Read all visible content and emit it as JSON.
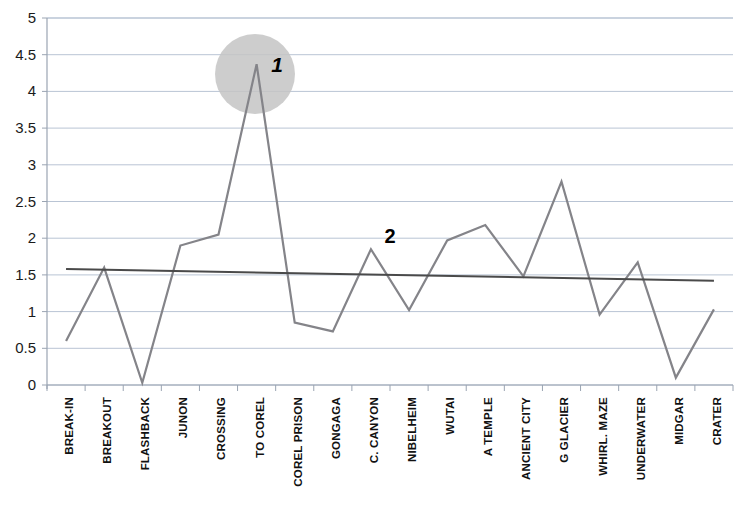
{
  "chart_data": {
    "type": "line",
    "title": "",
    "subtitle": "",
    "xlabel": "",
    "ylabel": "",
    "ylim": [
      0,
      5
    ],
    "yticks": [
      "0",
      "0.5",
      "1",
      "1.5",
      "2",
      "2.5",
      "3",
      "3.5",
      "4",
      "4.5",
      "5"
    ],
    "grid": true,
    "legend": "none",
    "categories": [
      "BREAK-IN",
      "BREAKOUT",
      "FLASHBACK",
      "JUNON",
      "CROSSING",
      "TO COREL",
      "COREL PRISON",
      "GONGAGA",
      "C. CANYON",
      "NIBELHEIM",
      "WUTAI",
      "A TEMPLE",
      "ANCIENT CITY",
      "G GLACIER",
      "WHIRL. MAZE",
      "UNDERWATER",
      "MIDGAR",
      "CRATER"
    ],
    "series": [
      {
        "name": "values",
        "color": "#848489",
        "values": [
          0.6,
          1.6,
          0.03,
          1.9,
          2.05,
          4.37,
          0.85,
          0.73,
          1.85,
          1.02,
          1.97,
          2.18,
          1.48,
          2.77,
          0.96,
          1.67,
          0.1,
          1.03
        ]
      },
      {
        "name": "trendline",
        "color": "#4a4a4a",
        "type": "linear-trend",
        "start_value": 1.58,
        "end_value": 1.42
      }
    ],
    "annotations": [
      {
        "label": "1",
        "kind": "highlight-circle-with-number",
        "target_category": "TO COREL",
        "circle_color": "#c4c4c4",
        "x_px": 255,
        "y_px": 74,
        "radius_px": 40,
        "label_x_px": 277,
        "label_y_px": 72,
        "label_style": "bold-italic",
        "label_size_px": 21
      },
      {
        "label": "2",
        "kind": "number",
        "x_px": 390,
        "y_px": 243,
        "label_style": "bold",
        "label_size_px": 20
      }
    ],
    "axis_colors": {
      "gridline": "#b9c4d4",
      "axis": "#9aa4b2",
      "tick_label": "#1a1a1a"
    }
  }
}
